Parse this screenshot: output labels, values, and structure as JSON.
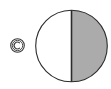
{
  "figure": {
    "title": "Half-shaded circle with circled C mark",
    "background_color": "#ffffff",
    "width": 111,
    "height": 89,
    "mark": {
      "icon_name": "circled-c-icon",
      "glyph": "©",
      "label": "C",
      "stroke_color": "#3a3a3a",
      "fill_color": "#ffffff",
      "center_x": 17.5,
      "center_y": 45.5,
      "outer_radius": 6.8,
      "inner_radius": 5.2,
      "stroke_width": 1.1
    },
    "circle": {
      "name": "divided-circle",
      "center_x": 71.5,
      "center_y": 46,
      "radius": 35.8,
      "outline_color": "#2b2b2b",
      "outline_width": 1.1,
      "left_half": {
        "name": "unshaded-left-half",
        "fill_color": "#ffffff",
        "label": "white"
      },
      "right_half": {
        "name": "shaded-right-half",
        "fill_color": "#ababab",
        "label": "gray"
      },
      "divider": {
        "name": "vertical-divider",
        "color": "#2b2b2b",
        "width": 1.6,
        "x": 71.5,
        "y_top": 10.2,
        "y_bottom": 81.8,
        "orientation": "vertical"
      }
    }
  }
}
